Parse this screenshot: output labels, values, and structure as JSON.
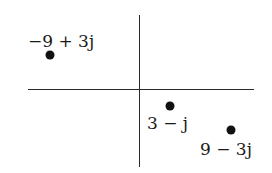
{
  "figure": {
    "axes": {
      "horizontal": "real",
      "vertical": "imaginary"
    },
    "points": [
      {
        "label": "−9 + 3j",
        "real": -9,
        "imag": 3,
        "dot": {
          "x": 50,
          "y": 55
        },
        "label_pos": {
          "x": 28,
          "y": 33
        }
      },
      {
        "label": "3 − j",
        "real": 3,
        "imag": -1,
        "dot": {
          "x": 170,
          "y": 106
        },
        "label_pos": {
          "x": 147,
          "y": 115
        }
      },
      {
        "label": "9 − 3j",
        "real": 9,
        "imag": -3,
        "dot": {
          "x": 231,
          "y": 130
        },
        "label_pos": {
          "x": 200,
          "y": 141
        }
      }
    ],
    "colors": {
      "axis": "#2a2a2a",
      "dot": "#111111",
      "text": "#1a1a1a",
      "background": "#ffffff"
    }
  }
}
